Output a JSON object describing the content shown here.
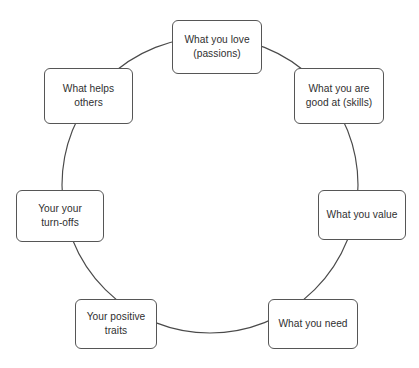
{
  "diagram": {
    "type": "cycle",
    "title": "",
    "background_color": "#ffffff",
    "ring": {
      "name": "circle-connector",
      "stroke_color": "#4a4a4a",
      "fill": "none",
      "center_x": 210,
      "center_y": 185,
      "radius": 148
    },
    "node_style": {
      "fill_color": "#ffffff",
      "border_color": "#565656",
      "text_color": "#2f2f2f",
      "corner_radius": 6
    },
    "nodes": [
      {
        "id": "passions",
        "label": "What you love\n(passions)",
        "position": "top",
        "x": 172,
        "y": 20,
        "w": 90,
        "h": 54
      },
      {
        "id": "skills",
        "label": "What you are\ngood at (skills)",
        "position": "top-right",
        "x": 294,
        "y": 68,
        "w": 90,
        "h": 56
      },
      {
        "id": "values",
        "label": "What you value",
        "position": "right",
        "x": 318,
        "y": 190,
        "w": 88,
        "h": 50
      },
      {
        "id": "needs",
        "label": "What you need",
        "position": "bottom-right",
        "x": 268,
        "y": 299,
        "w": 90,
        "h": 50
      },
      {
        "id": "positive-traits",
        "label": "Your positive\ntraits",
        "position": "bottom-left",
        "x": 75,
        "y": 299,
        "w": 82,
        "h": 50
      },
      {
        "id": "turn-offs",
        "label": "Your your\nturn-offs",
        "position": "left",
        "x": 16,
        "y": 190,
        "w": 88,
        "h": 52
      },
      {
        "id": "helps-others",
        "label": "What helps\nothers",
        "position": "top-left",
        "x": 44,
        "y": 68,
        "w": 89,
        "h": 56
      }
    ]
  }
}
